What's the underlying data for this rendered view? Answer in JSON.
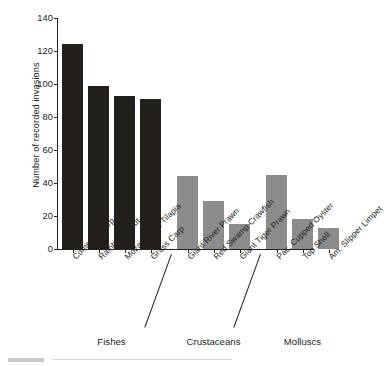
{
  "chart_data": {
    "type": "bar",
    "title": "",
    "xlabel": "",
    "ylabel": "Number of recorded invasions",
    "ylim": [
      0,
      140
    ],
    "yticks": [
      0,
      20,
      40,
      60,
      80,
      100,
      120,
      140
    ],
    "grid": false,
    "legend": null,
    "categories": [
      "Common Carp",
      "Rainbow Trout",
      "Mozambique Tilapia",
      "Grass Carp",
      "Giant River Prawn",
      "Red Swamp Crawfish",
      "Giant Tiger Prawn",
      "Pac. Cupped Oyster",
      "Top Shell",
      "Am. Slipper Limpet"
    ],
    "values": [
      124,
      99,
      93,
      91,
      44,
      29,
      15,
      45,
      18,
      13
    ],
    "groups": [
      {
        "label": "Fishes",
        "categories": [
          "Common Carp",
          "Rainbow Trout",
          "Mozambique Tilapia",
          "Grass Carp"
        ],
        "color": "#231f1a"
      },
      {
        "label": "Crustaceans",
        "categories": [
          "Giant River Prawn",
          "Red Swamp Crawfish",
          "Giant Tiger Prawn"
        ],
        "color": "#8c8c8c"
      },
      {
        "label": "Molluscs",
        "categories": [
          "Pac. Cupped Oyster",
          "Top Shell",
          "Am. Slipper Limpet"
        ],
        "color": "#8c8c8c"
      }
    ],
    "colors": {
      "fishes_bar": "#231f1a",
      "crustaceans_bar": "#8c8c8c",
      "molluscs_bar": "#8c8c8c",
      "axis": "#231f20",
      "text": "#231f20",
      "background": "#ffffff"
    }
  }
}
